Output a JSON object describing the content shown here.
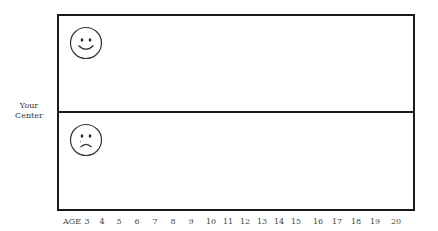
{
  "side_label": {
    "line1": "Your",
    "line2": "Center"
  },
  "panels": {
    "top": {
      "icon": "happy-face-icon"
    },
    "bottom": {
      "icon": "sad-face-icon"
    }
  },
  "axis": {
    "title": "AGE",
    "ticks": [
      "3",
      "4",
      "5",
      "6",
      "7",
      "8",
      "9",
      "10",
      "11",
      "12",
      "13",
      "14",
      "15",
      "16",
      "17",
      "18",
      "19",
      "20"
    ]
  },
  "colors": {
    "border": "#1a1a1a",
    "text": "#333333"
  }
}
